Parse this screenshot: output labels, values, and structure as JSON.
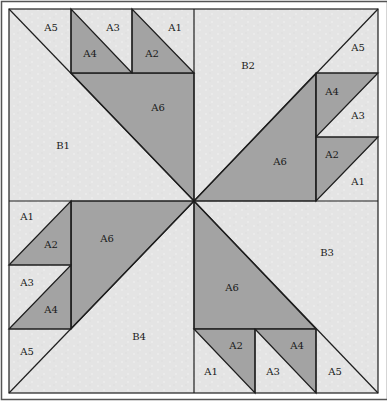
{
  "diagram": {
    "title": "",
    "colors": {
      "light_fabric": "#e4e4e4",
      "dark_fabric": "#a3a3a3",
      "line": "#1e1e1e",
      "frame": "#555555"
    },
    "quadrants": {
      "top_left": {
        "background": "B1",
        "labels": [
          "A5",
          "A3",
          "A1",
          "A4",
          "A2",
          "A6",
          "B1"
        ]
      },
      "top_right": {
        "background": "B2",
        "labels": [
          "A5",
          "A4",
          "A3",
          "A2",
          "A1",
          "A6",
          "B2"
        ]
      },
      "bottom_left": {
        "background": "B4",
        "labels": [
          "A1",
          "A2",
          "A3",
          "A4",
          "A5",
          "A6",
          "B4"
        ]
      },
      "bottom_right": {
        "background": "B3",
        "labels": [
          "A2",
          "A4",
          "A1",
          "A3",
          "A5",
          "A6",
          "B3"
        ]
      }
    },
    "labels": {
      "tl_a5": "A5",
      "tl_a3": "A3",
      "tl_a1": "A1",
      "tl_a4": "A4",
      "tl_a2": "A2",
      "tl_a6": "A6",
      "tl_b1": "B1",
      "tr_a5": "A5",
      "tr_a4": "A4",
      "tr_a3": "A3",
      "tr_a2": "A2",
      "tr_a1": "A1",
      "tr_a6": "A6",
      "tr_b2": "B2",
      "bl_a1": "A1",
      "bl_a2": "A2",
      "bl_a3": "A3",
      "bl_a4": "A4",
      "bl_a5": "A5",
      "bl_a6": "A6",
      "bl_b4": "B4",
      "br_a2": "A2",
      "br_a4": "A4",
      "br_a1": "A1",
      "br_a3": "A3",
      "br_a5": "A5",
      "br_a6": "A6",
      "br_b3": "B3"
    }
  }
}
